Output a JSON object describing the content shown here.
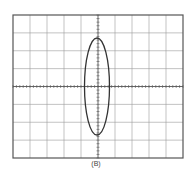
{
  "figure": {
    "caption": "(B)",
    "graticule": {
      "columns": 10,
      "rows": 8,
      "left": 13,
      "top": 15,
      "right": 183,
      "bottom": 158,
      "center_x": 97,
      "center_y": 86,
      "line_color": "#9a9a9a",
      "frame_color": "#555555"
    },
    "trace": {
      "shape": "ellipse",
      "cx": 97,
      "cy": 86.5,
      "rx": 12.5,
      "ry": 48.5,
      "color": "#333333"
    }
  }
}
